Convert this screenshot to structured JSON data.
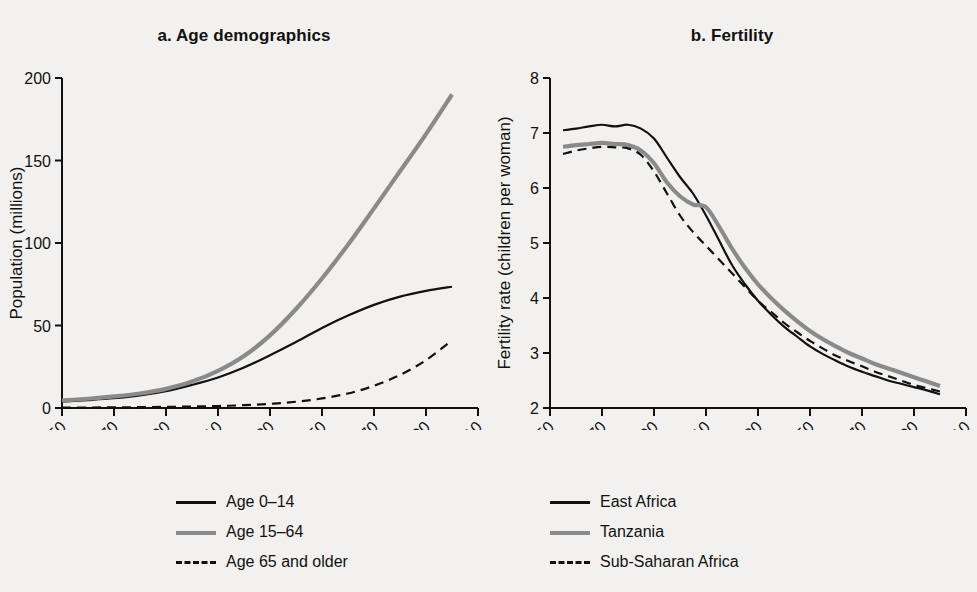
{
  "figure": {
    "panels": [
      {
        "id": "panel-a",
        "title": "a. Age demographics",
        "ylabel": "Population (millions)",
        "yticks": [
          "0",
          "50",
          "100",
          "150",
          "200"
        ],
        "xticks": [
          "1950",
          "1970",
          "1990",
          "2010",
          "2030",
          "2050",
          "2070",
          "2090",
          "2110"
        ],
        "legend": [
          {
            "label": "Age 0–14",
            "style": "solid-black",
            "color": "#111111"
          },
          {
            "label": "Age 15–64",
            "style": "solid-gray",
            "color": "#8a8a8a"
          },
          {
            "label": "Age 65 and older",
            "style": "dashed",
            "color": "#111111"
          }
        ]
      },
      {
        "id": "panel-b",
        "title": "b. Fertility",
        "ylabel": "Fertility rate (children per woman)",
        "yticks": [
          "2",
          "3",
          "4",
          "5",
          "6",
          "7",
          "8"
        ],
        "xticks": [
          "1950",
          "1970",
          "1990",
          "2010",
          "2030",
          "2050",
          "2070",
          "2090",
          "2110"
        ],
        "legend": [
          {
            "label": "East Africa",
            "style": "solid-black",
            "color": "#111111"
          },
          {
            "label": "Tanzania",
            "style": "solid-gray",
            "color": "#8a8a8a"
          },
          {
            "label": "Sub-Saharan Africa",
            "style": "dashed",
            "color": "#111111"
          }
        ]
      }
    ]
  },
  "chart_data": [
    {
      "type": "line",
      "panel": "a",
      "title": "a. Age demographics",
      "xlabel": "",
      "ylabel": "Population (millions)",
      "xlim": [
        1950,
        2110
      ],
      "ylim": [
        0,
        200
      ],
      "xticks": [
        1950,
        1970,
        1990,
        2010,
        2030,
        2050,
        2070,
        2090,
        2110
      ],
      "yticks": [
        0,
        50,
        100,
        150,
        200
      ],
      "grid": false,
      "legend_position": "below",
      "x": [
        1950,
        1960,
        1970,
        1980,
        1990,
        2000,
        2010,
        2020,
        2030,
        2040,
        2050,
        2060,
        2070,
        2080,
        2090,
        2100
      ],
      "series": [
        {
          "name": "Age 0–14",
          "color": "#111111",
          "dash": "solid",
          "values": [
            3.9,
            4.8,
            5.9,
            7.6,
            10.2,
            14.0,
            18.5,
            24.5,
            32.0,
            40.0,
            48.5,
            56.0,
            62.5,
            67.5,
            71.0,
            73.5
          ]
        },
        {
          "name": "Age 15–64",
          "color": "#8a8a8a",
          "dash": "solid",
          "values": [
            4.6,
            5.6,
            7.0,
            8.8,
            11.6,
            16.0,
            22.5,
            31.5,
            44.0,
            60.0,
            78.5,
            99.0,
            121.0,
            143.5,
            166.0,
            190.0
          ]
        },
        {
          "name": "Age 65 and older",
          "color": "#111111",
          "dash": "dashed",
          "values": [
            0.2,
            0.3,
            0.4,
            0.5,
            0.7,
            0.9,
            1.2,
            1.7,
            2.5,
            3.8,
            5.8,
            8.8,
            13.5,
            20.0,
            29.0,
            41.0
          ]
        }
      ]
    },
    {
      "type": "line",
      "panel": "b",
      "title": "b. Fertility",
      "xlabel": "",
      "ylabel": "Fertility rate (children per woman)",
      "xlim": [
        1950,
        2110
      ],
      "ylim": [
        2,
        8
      ],
      "xticks": [
        1950,
        1970,
        1990,
        2010,
        2030,
        2050,
        2070,
        2090,
        2110
      ],
      "yticks": [
        2,
        3,
        4,
        5,
        6,
        7,
        8
      ],
      "grid": false,
      "legend_position": "below",
      "x": [
        1955,
        1960,
        1965,
        1970,
        1975,
        1980,
        1985,
        1990,
        1995,
        2000,
        2005,
        2010,
        2015,
        2020,
        2025,
        2030,
        2035,
        2040,
        2045,
        2050,
        2055,
        2060,
        2065,
        2070,
        2075,
        2080,
        2085,
        2090,
        2095,
        2100
      ],
      "series": [
        {
          "name": "East Africa",
          "color": "#111111",
          "dash": "solid",
          "values": [
            7.05,
            7.08,
            7.12,
            7.15,
            7.12,
            7.15,
            7.08,
            6.9,
            6.55,
            6.2,
            5.9,
            5.5,
            5.05,
            4.6,
            4.25,
            3.95,
            3.7,
            3.48,
            3.3,
            3.12,
            2.98,
            2.86,
            2.75,
            2.66,
            2.58,
            2.5,
            2.44,
            2.38,
            2.32,
            2.25
          ]
        },
        {
          "name": "Tanzania",
          "color": "#8a8a8a",
          "dash": "solid",
          "values": [
            6.75,
            6.78,
            6.8,
            6.82,
            6.8,
            6.78,
            6.68,
            6.45,
            6.1,
            5.85,
            5.7,
            5.65,
            5.3,
            4.9,
            4.55,
            4.25,
            4.0,
            3.78,
            3.58,
            3.4,
            3.25,
            3.12,
            3.0,
            2.9,
            2.8,
            2.72,
            2.64,
            2.56,
            2.48,
            2.4
          ]
        },
        {
          "name": "Sub-Saharan Africa",
          "color": "#111111",
          "dash": "dashed",
          "values": [
            6.62,
            6.68,
            6.72,
            6.75,
            6.74,
            6.72,
            6.6,
            6.3,
            5.9,
            5.5,
            5.2,
            4.95,
            4.7,
            4.45,
            4.2,
            3.95,
            3.75,
            3.55,
            3.38,
            3.22,
            3.08,
            2.95,
            2.85,
            2.76,
            2.66,
            2.58,
            2.5,
            2.42,
            2.36,
            2.3
          ]
        }
      ]
    }
  ]
}
